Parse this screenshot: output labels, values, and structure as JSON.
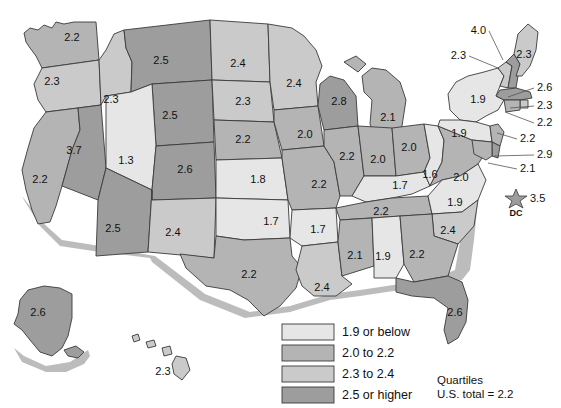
{
  "chart_data": {
    "type": "choropleth-map",
    "title": "",
    "legend_title": "Quartiles",
    "note": "U.S. total = 2.2",
    "legend_position": "bottom-center",
    "bins": [
      {
        "label": "1.9 or below",
        "color": "#e6e6e6",
        "min": 0.0,
        "max": 1.9
      },
      {
        "label": "2.0 to 2.2",
        "color": "#b4b4b4",
        "min": 2.0,
        "max": 2.2
      },
      {
        "label": "2.3 to 2.4",
        "color": "#cacaca",
        "min": 2.3,
        "max": 2.4
      },
      {
        "label": "2.5 or higher",
        "color": "#9d9d9d",
        "min": 2.5,
        "max": 4.0
      }
    ],
    "categories": [
      "WA",
      "OR",
      "CA",
      "NV",
      "ID",
      "MT",
      "WY",
      "UT",
      "AZ",
      "CO",
      "NM",
      "ND",
      "SD",
      "NE",
      "KS",
      "OK",
      "TX",
      "MN",
      "IA",
      "MO",
      "AR",
      "LA",
      "WI",
      "IL",
      "MI",
      "IN",
      "OH",
      "KY",
      "TN",
      "MS",
      "AL",
      "WV",
      "VA",
      "NC",
      "SC",
      "GA",
      "FL",
      "NY",
      "PA",
      "VT",
      "NH",
      "ME",
      "MA",
      "RI",
      "CT",
      "NJ",
      "DE",
      "MD",
      "DC",
      "AK",
      "HI"
    ],
    "values": [
      2.2,
      2.3,
      2.2,
      3.7,
      2.3,
      2.5,
      2.5,
      1.3,
      2.5,
      2.6,
      2.4,
      2.4,
      2.3,
      2.2,
      1.8,
      1.7,
      2.2,
      2.4,
      2.0,
      2.2,
      1.7,
      2.4,
      2.8,
      2.2,
      2.1,
      2.0,
      2.0,
      1.7,
      2.2,
      2.1,
      1.9,
      1.6,
      2.0,
      1.9,
      2.4,
      2.2,
      2.6,
      1.9,
      1.9,
      2.3,
      4.0,
      2.3,
      2.6,
      2.3,
      2.2,
      2.2,
      2.9,
      2.1,
      3.5,
      2.6,
      2.3
    ],
    "xlabel": "",
    "ylabel": ""
  },
  "map": {
    "inline_labels": [
      {
        "state": "WA",
        "value": "2.2",
        "x": 72,
        "y": 38
      },
      {
        "state": "OR",
        "value": "2.3",
        "x": 52,
        "y": 82
      },
      {
        "state": "CA",
        "value": "2.2",
        "x": 40,
        "y": 180
      },
      {
        "state": "NV",
        "value": "3.7",
        "x": 74,
        "y": 151
      },
      {
        "state": "ID",
        "value": "2.3",
        "x": 111,
        "y": 100
      },
      {
        "state": "MT",
        "value": "2.5",
        "x": 161,
        "y": 61
      },
      {
        "state": "WY",
        "value": "2.5",
        "x": 170,
        "y": 116
      },
      {
        "state": "UT",
        "value": "1.3",
        "x": 126,
        "y": 161
      },
      {
        "state": "AZ",
        "value": "2.5",
        "x": 113,
        "y": 229
      },
      {
        "state": "CO",
        "value": "2.6",
        "x": 185,
        "y": 170
      },
      {
        "state": "NM",
        "value": "2.4",
        "x": 173,
        "y": 233
      },
      {
        "state": "ND",
        "value": "2.4",
        "x": 238,
        "y": 64
      },
      {
        "state": "SD",
        "value": "2.3",
        "x": 243,
        "y": 102
      },
      {
        "state": "NE",
        "value": "2.2",
        "x": 243,
        "y": 140
      },
      {
        "state": "KS",
        "value": "1.8",
        "x": 258,
        "y": 180
      },
      {
        "state": "OK",
        "value": "1.7",
        "x": 271,
        "y": 222
      },
      {
        "state": "TX",
        "value": "2.2",
        "x": 249,
        "y": 275
      },
      {
        "state": "MN",
        "value": "2.4",
        "x": 294,
        "y": 84
      },
      {
        "state": "IA",
        "value": "2.0",
        "x": 305,
        "y": 135
      },
      {
        "state": "MO",
        "value": "2.2",
        "x": 319,
        "y": 185
      },
      {
        "state": "AR",
        "value": "1.7",
        "x": 318,
        "y": 230
      },
      {
        "state": "LA",
        "value": "2.4",
        "x": 322,
        "y": 288
      },
      {
        "state": "WI",
        "value": "2.8",
        "x": 339,
        "y": 102
      },
      {
        "state": "IL",
        "value": "2.2",
        "x": 347,
        "y": 157
      },
      {
        "state": "MI",
        "value": "2.1",
        "x": 388,
        "y": 118
      },
      {
        "state": "IN",
        "value": "2.0",
        "x": 378,
        "y": 160
      },
      {
        "state": "OH",
        "value": "2.0",
        "x": 409,
        "y": 148
      },
      {
        "state": "KY",
        "value": "1.7",
        "x": 400,
        "y": 186
      },
      {
        "state": "TN",
        "value": "2.2",
        "x": 381,
        "y": 212
      },
      {
        "state": "MS",
        "value": "2.1",
        "x": 355,
        "y": 256
      },
      {
        "state": "AL",
        "value": "1.9",
        "x": 383,
        "y": 257
      },
      {
        "state": "WV",
        "value": "1.6",
        "x": 430,
        "y": 175
      },
      {
        "state": "VA",
        "value": "2.0",
        "x": 461,
        "y": 178
      },
      {
        "state": "NC",
        "value": "1.9",
        "x": 455,
        "y": 203
      },
      {
        "state": "SC",
        "value": "2.4",
        "x": 448,
        "y": 231
      },
      {
        "state": "GA",
        "value": "2.2",
        "x": 417,
        "y": 255
      },
      {
        "state": "FL",
        "value": "2.6",
        "x": 455,
        "y": 313
      },
      {
        "state": "NY",
        "value": "1.9",
        "x": 478,
        "y": 100
      },
      {
        "state": "PA",
        "value": "1.9",
        "x": 459,
        "y": 134
      },
      {
        "state": "ME",
        "value": "2.3",
        "x": 524,
        "y": 55
      },
      {
        "state": "AK",
        "value": "2.6",
        "x": 38,
        "y": 313
      },
      {
        "state": "HI",
        "value": "2.3",
        "x": 163,
        "y": 372
      }
    ],
    "leader_labels": [
      {
        "state": "NH",
        "value": "4.0",
        "lx": 489,
        "ly": 31,
        "ax": 503,
        "ay": 60
      },
      {
        "state": "VT",
        "value": "2.3",
        "lx": 469,
        "ly": 56,
        "ax": 498,
        "ay": 68
      },
      {
        "state": "MA",
        "value": "2.6",
        "lx": 534,
        "ly": 88,
        "ax": 508,
        "ay": 97
      },
      {
        "state": "RI",
        "value": "2.3",
        "lx": 534,
        "ly": 106,
        "ax": 510,
        "ay": 108
      },
      {
        "state": "CT",
        "value": "2.2",
        "lx": 534,
        "ly": 123,
        "ax": 505,
        "ay": 112
      },
      {
        "state": "NJ",
        "value": "2.2",
        "lx": 517,
        "ly": 139,
        "ax": 497,
        "ay": 133
      },
      {
        "state": "DE",
        "value": "2.9",
        "lx": 534,
        "ly": 155,
        "ax": 494,
        "ay": 156
      },
      {
        "state": "MD",
        "value": "2.1",
        "lx": 517,
        "ly": 169,
        "ax": 488,
        "ay": 163
      }
    ],
    "dc": {
      "value": "3.5",
      "tag": "DC",
      "x": 516,
      "y": 199
    }
  },
  "legend": {
    "items": [
      {
        "label": "1.9 or below",
        "color": "#e6e6e6"
      },
      {
        "label": "2.0 to 2.2",
        "color": "#b4b4b4"
      },
      {
        "label": "2.3 to 2.4",
        "color": "#cacaca"
      },
      {
        "label": "2.5 or higher",
        "color": "#9d9d9d"
      }
    ],
    "note_line1": "Quartiles",
    "note_line2": "U.S. total = 2.2"
  }
}
